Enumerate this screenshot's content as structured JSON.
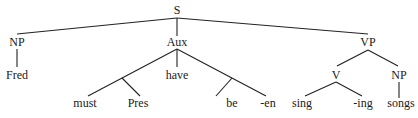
{
  "diagram": {
    "type": "syntax-tree",
    "nodes": [
      {
        "id": "S",
        "label": "S",
        "x": 177,
        "y": 14
      },
      {
        "id": "NP1",
        "label": "NP",
        "x": 17,
        "y": 46
      },
      {
        "id": "Aux",
        "label": "Aux",
        "x": 177,
        "y": 46
      },
      {
        "id": "VP",
        "label": "VP",
        "x": 368,
        "y": 46
      },
      {
        "id": "Fred",
        "label": "Fred",
        "x": 17,
        "y": 79
      },
      {
        "id": "have",
        "label": "have",
        "x": 177,
        "y": 79
      },
      {
        "id": "must",
        "label": "must",
        "x": 85,
        "y": 107
      },
      {
        "id": "Pres",
        "label": "Pres",
        "x": 138,
        "y": 107
      },
      {
        "id": "be",
        "label": "be",
        "x": 232,
        "y": 107
      },
      {
        "id": "en",
        "label": "-en",
        "x": 268,
        "y": 107
      },
      {
        "id": "V",
        "label": "V",
        "x": 336,
        "y": 79
      },
      {
        "id": "NP2",
        "label": "NP",
        "x": 399,
        "y": 79
      },
      {
        "id": "sing",
        "label": "sing",
        "x": 302,
        "y": 107
      },
      {
        "id": "ing",
        "label": "-ing",
        "x": 363,
        "y": 107
      },
      {
        "id": "songs",
        "label": "songs",
        "x": 401,
        "y": 107
      }
    ],
    "edges": [
      {
        "x1": 177,
        "y1": 18,
        "x2": 17,
        "y2": 34
      },
      {
        "x1": 177,
        "y1": 18,
        "x2": 177,
        "y2": 36
      },
      {
        "x1": 177,
        "y1": 18,
        "x2": 368,
        "y2": 34
      },
      {
        "x1": 17,
        "y1": 49,
        "x2": 17,
        "y2": 67
      },
      {
        "x1": 177,
        "y1": 49,
        "x2": 177,
        "y2": 67
      },
      {
        "x1": 177,
        "y1": 49,
        "x2": 88,
        "y2": 96
      },
      {
        "x1": 122,
        "y1": 78,
        "x2": 140,
        "y2": 96
      },
      {
        "x1": 177,
        "y1": 49,
        "x2": 266,
        "y2": 96
      },
      {
        "x1": 232,
        "y1": 78,
        "x2": 216,
        "y2": 96
      },
      {
        "x1": 368,
        "y1": 50,
        "x2": 337,
        "y2": 66
      },
      {
        "x1": 368,
        "y1": 50,
        "x2": 398,
        "y2": 66
      },
      {
        "x1": 336,
        "y1": 82,
        "x2": 305,
        "y2": 96
      },
      {
        "x1": 336,
        "y1": 82,
        "x2": 362,
        "y2": 96
      },
      {
        "x1": 399,
        "y1": 82,
        "x2": 399,
        "y2": 98
      }
    ]
  }
}
